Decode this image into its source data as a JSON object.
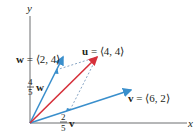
{
  "axes": {
    "x_label": "x",
    "y_label": "y"
  },
  "vectors": {
    "u": {
      "name": "u",
      "components": "⟨4, 4⟩",
      "label_rest": " = ⟨4, 4⟩",
      "color": "#d6303a"
    },
    "v": {
      "name": "v",
      "components": "⟨6, 2⟩",
      "label_rest": " = ⟨6, 2⟩",
      "color": "#3a8fcc"
    },
    "w": {
      "name": "w",
      "components": "⟨2, 4⟩",
      "label_rest": " = ⟨2, 4⟩",
      "color": "#3a8fcc"
    }
  },
  "scaled": {
    "w_scalar": {
      "num": "4",
      "den": "5",
      "vec": "w"
    },
    "v_scalar": {
      "num": "2",
      "den": "5",
      "vec": "v"
    }
  },
  "colors": {
    "axis": "#6d6e71",
    "dashed": "#6b8fb5"
  }
}
